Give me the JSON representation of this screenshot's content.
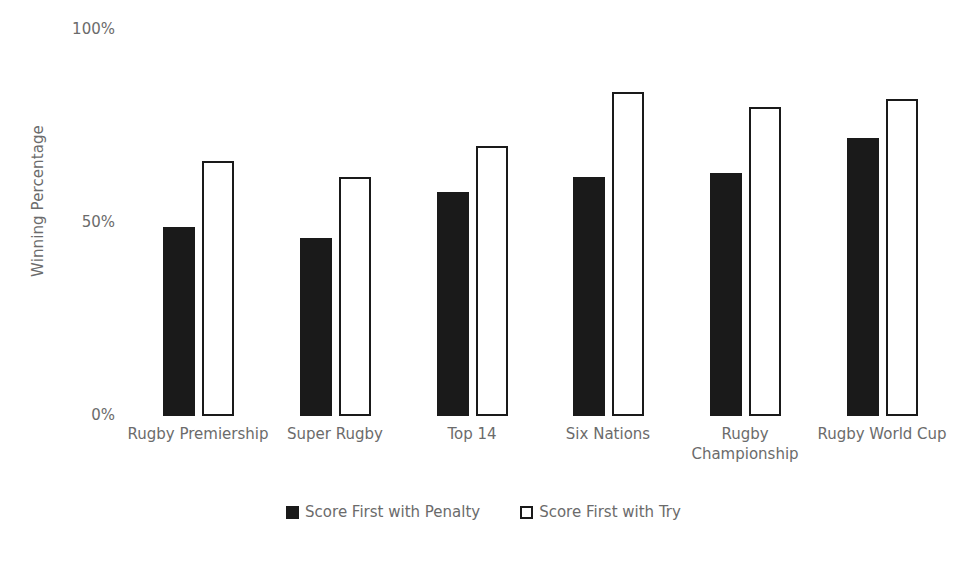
{
  "chart_data": {
    "type": "bar",
    "title": "",
    "xlabel": "",
    "ylabel": "Winning Percentage",
    "ylim": [
      0,
      100
    ],
    "ytick_labels": [
      "100%",
      "50%",
      "0%"
    ],
    "ytick_values": [
      100,
      50,
      0
    ],
    "grid": false,
    "legend_position": "bottom",
    "categories": [
      "Rugby Premiership",
      "Super Rugby",
      "Top 14",
      "Six Nations",
      "Rugby Championship",
      "Rugby World Cup"
    ],
    "series": [
      {
        "name": "Score First with Penalty",
        "color": "#1a1a1a",
        "style": "filled",
        "values": [
          49,
          46,
          58,
          62,
          63,
          72
        ]
      },
      {
        "name": "Score First with Try",
        "color": "#ffffff",
        "style": "outlined",
        "values": [
          66,
          62,
          70,
          84,
          80,
          82
        ]
      }
    ]
  },
  "legend": {
    "items": [
      {
        "label": "Score First with Penalty",
        "swatch": "filled-square-icon"
      },
      {
        "label": "Score First with Try",
        "swatch": "outlined-square-icon"
      }
    ]
  }
}
